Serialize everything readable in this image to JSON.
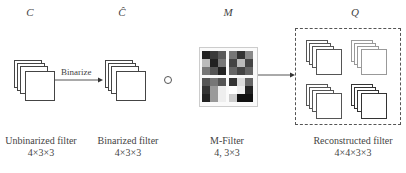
{
  "symbols": {
    "c": "C",
    "c_hat": "Ĉ",
    "m": "M",
    "q": "Q"
  },
  "arrow_label": "Binarize",
  "operator_symbol": "○",
  "captions": {
    "unbinarized": {
      "title": "Unbinarized filter",
      "dims": "4×3×3"
    },
    "binarized": {
      "title": "Binarized filter",
      "dims": "4×3×3"
    },
    "mfilter": {
      "title": "M-Filter",
      "dims": "4,  3×3"
    },
    "reconstructed": {
      "title": "Reconstructed filter",
      "dims": "4×4×3×3"
    }
  },
  "mfilter_blocks": [
    [
      "#222",
      "#3a3a3a",
      "#5a5a5a",
      "#bbb",
      "#222",
      "#777",
      "#777",
      "#555",
      "#222"
    ],
    [
      "#777",
      "#333",
      "#888",
      "#444",
      "#bbb",
      "#444",
      "#666",
      "#444",
      "#666"
    ],
    [
      "#555",
      "#777",
      "#555",
      "#333",
      "#999",
      "#eee",
      "#222",
      "#999",
      "#eee"
    ],
    [
      "#333",
      "#ddd",
      "#666",
      "#fff",
      "#eee",
      "#222",
      "#ccc",
      "#111",
      "#111"
    ]
  ],
  "q_stack_colors": [
    "#555",
    "#999",
    "#555",
    "#333"
  ]
}
